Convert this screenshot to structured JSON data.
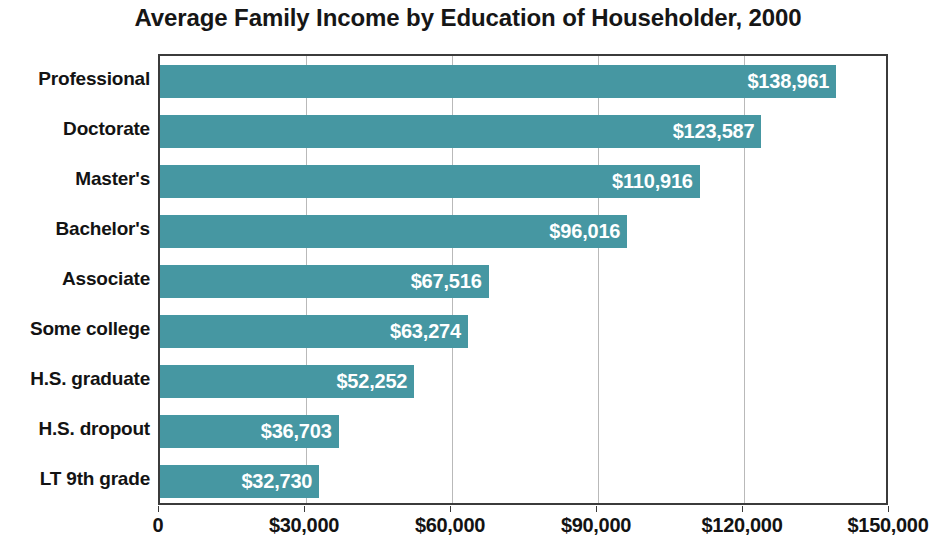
{
  "chart_data": {
    "type": "bar",
    "orientation": "horizontal",
    "title": "Average Family Income by Education of Householder, 2000",
    "xlabel": "",
    "ylabel": "",
    "xlim": [
      0,
      150000
    ],
    "grid": true,
    "legend": "none",
    "bar_color": "#4697a2",
    "value_label_color": "#ffffff",
    "axis_color": "#3b3b3b",
    "categories": [
      "Professional",
      "Doctorate",
      "Master's",
      "Bachelor's",
      "Associate",
      "Some college",
      "H.S. graduate",
      "H.S. dropout",
      "LT 9th grade"
    ],
    "values": [
      138961,
      123587,
      110916,
      96016,
      67516,
      63274,
      52252,
      36703,
      32730
    ],
    "value_labels": [
      "$138,961",
      "$123,587",
      "$110,916",
      "$96,016",
      "$67,516",
      "$63,274",
      "$52,252",
      "$36,703",
      "$32,730"
    ],
    "xticks": [
      0,
      30000,
      60000,
      90000,
      120000,
      150000
    ],
    "xtick_labels": [
      "0",
      "$30,000",
      "$60,000",
      "$90,000",
      "$120,000",
      "$150,000"
    ]
  }
}
